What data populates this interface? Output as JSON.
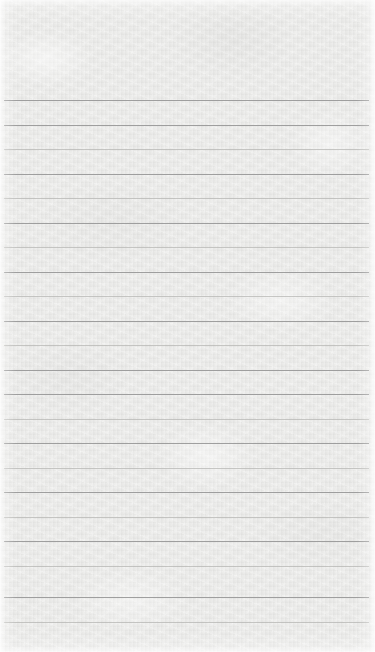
{
  "document": {
    "type": "ruled-notepad-paper",
    "title": "Blank Lined Notepad Page",
    "content_text": "",
    "is_blank": true,
    "width_px": 375,
    "height_px": 652
  },
  "paper": {
    "background_color": "#e8e8e6",
    "texture": "fibrous-grain",
    "edge_highlight_color": "#ffffff"
  },
  "ruling": {
    "line_color": "#9a9a9a",
    "line_color_light": "#b4b4b2",
    "line_thickness_px": 1,
    "line_spacing_px": 24.5,
    "first_line_y_px": 100,
    "last_line_y_px": 622,
    "line_left_inset_px": 4,
    "line_right_inset_px": 6,
    "line_count": 22,
    "has_vertical_margin_rule": false,
    "top_margin_px": 100,
    "bottom_margin_px": 30,
    "lines": [
      {
        "y": 100,
        "shade": "dark"
      },
      {
        "y": 124.5,
        "shade": "dark"
      },
      {
        "y": 149,
        "shade": "light"
      },
      {
        "y": 173.5,
        "shade": "dark"
      },
      {
        "y": 198,
        "shade": "light"
      },
      {
        "y": 222.5,
        "shade": "dark"
      },
      {
        "y": 247,
        "shade": "light"
      },
      {
        "y": 271.5,
        "shade": "dark"
      },
      {
        "y": 296,
        "shade": "light"
      },
      {
        "y": 320.5,
        "shade": "dark"
      },
      {
        "y": 345,
        "shade": "light"
      },
      {
        "y": 369.5,
        "shade": "dark"
      },
      {
        "y": 394,
        "shade": "dark"
      },
      {
        "y": 418.5,
        "shade": "light"
      },
      {
        "y": 443,
        "shade": "dark"
      },
      {
        "y": 467.5,
        "shade": "light"
      },
      {
        "y": 492,
        "shade": "dark"
      },
      {
        "y": 516.5,
        "shade": "light"
      },
      {
        "y": 541,
        "shade": "dark"
      },
      {
        "y": 565.5,
        "shade": "light"
      },
      {
        "y": 597,
        "shade": "dark"
      },
      {
        "y": 622,
        "shade": "light"
      }
    ]
  }
}
